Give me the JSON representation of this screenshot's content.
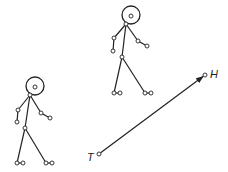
{
  "diagram": {
    "stroke_color": "#222222",
    "background": "#ffffff",
    "figures": [
      {
        "name": "stick-figure-upper",
        "head": {
          "cx": 131,
          "cy": 15,
          "r": 9,
          "eye": [
            131,
            16
          ]
        },
        "neck": [
          126,
          24
        ],
        "left_elbow": [
          114,
          38
        ],
        "left_hand": [
          113,
          51
        ],
        "right_elbow": [
          138,
          41
        ],
        "right_hand": [
          147,
          46
        ],
        "hip": [
          122,
          57
        ],
        "left_foot": [
          [
            114,
            93
          ],
          [
            120,
            93
          ]
        ],
        "right_foot": [
          [
            145,
            93
          ],
          [
            151,
            93
          ]
        ]
      },
      {
        "name": "stick-figure-lower",
        "head": {
          "cx": 35,
          "cy": 86,
          "r": 9,
          "eye": [
            35,
            87
          ]
        },
        "neck": [
          30,
          95
        ],
        "left_elbow": [
          18,
          110
        ],
        "left_hand": [
          17,
          122
        ],
        "right_elbow": [
          41,
          113
        ],
        "right_hand": [
          50,
          118
        ],
        "hip": [
          25,
          128
        ],
        "left_foot": [
          [
            17,
            163
          ],
          [
            23,
            163
          ]
        ],
        "right_foot": [
          [
            46,
            163
          ],
          [
            52,
            163
          ]
        ]
      }
    ],
    "vector": {
      "tail": [
        99,
        154
      ],
      "head": [
        205,
        75
      ],
      "tail_label": "T",
      "head_label": "H"
    }
  }
}
